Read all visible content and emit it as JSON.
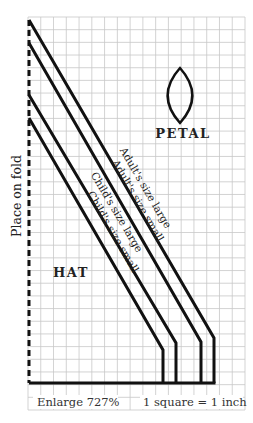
{
  "labels": {
    "fold": "Place on fold",
    "petal": "PETAL",
    "hat": "HAT",
    "enlarge": "Enlarge 727%",
    "scale": "1 square = 1 inch"
  },
  "grid": {
    "x0": 28,
    "y0": 17,
    "x1": 245,
    "y1": 410,
    "cols": 17,
    "rows": 31,
    "line_color": "#c8c8c8"
  },
  "colors": {
    "ink": "#111111",
    "text": "#222222",
    "background": "#ffffff"
  },
  "pattern": {
    "fold_x": 29,
    "base_y": 383,
    "sizes": [
      {
        "id": "adult-large",
        "label": "Adult's size large",
        "start_y": 20,
        "bend_x": 214,
        "bend_y": 338
      },
      {
        "id": "adult-small",
        "label": "Adult's size small",
        "start_y": 43,
        "bend_x": 201,
        "bend_y": 342
      },
      {
        "id": "child-large",
        "label": "Child's size large",
        "start_y": 95,
        "bend_x": 176,
        "bend_y": 343
      },
      {
        "id": "child-small",
        "label": "Child's size small",
        "start_y": 118,
        "bend_x": 163,
        "bend_y": 350
      }
    ]
  },
  "petal": {
    "cx": 180,
    "top_y": 68,
    "bottom_y": 123,
    "half_width": 13
  }
}
